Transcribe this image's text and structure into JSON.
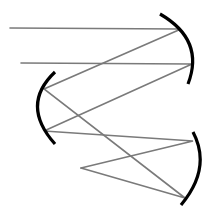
{
  "diagram": {
    "type": "optical ray diagram",
    "colors": {
      "ray": "#7a7a7a",
      "mirror": "#000000",
      "background": "#ffffff"
    },
    "mirrors": [
      {
        "name": "top-right-mirror",
        "path": "M160,14 Q205,40 188,84"
      },
      {
        "name": "left-mirror",
        "path": "M55,72 Q20,105 55,144"
      },
      {
        "name": "bottom-right-mirror",
        "path": "M193,132 Q212,168 181,205"
      }
    ],
    "rays": [
      {
        "name": "ray-1",
        "points": "10,28 181,29 44,89 185,198 81,168"
      },
      {
        "name": "ray-2",
        "points": "21,63 192,64 44,131 193,141 81,168"
      }
    ],
    "focal_point": {
      "x": 81,
      "y": 168
    }
  }
}
